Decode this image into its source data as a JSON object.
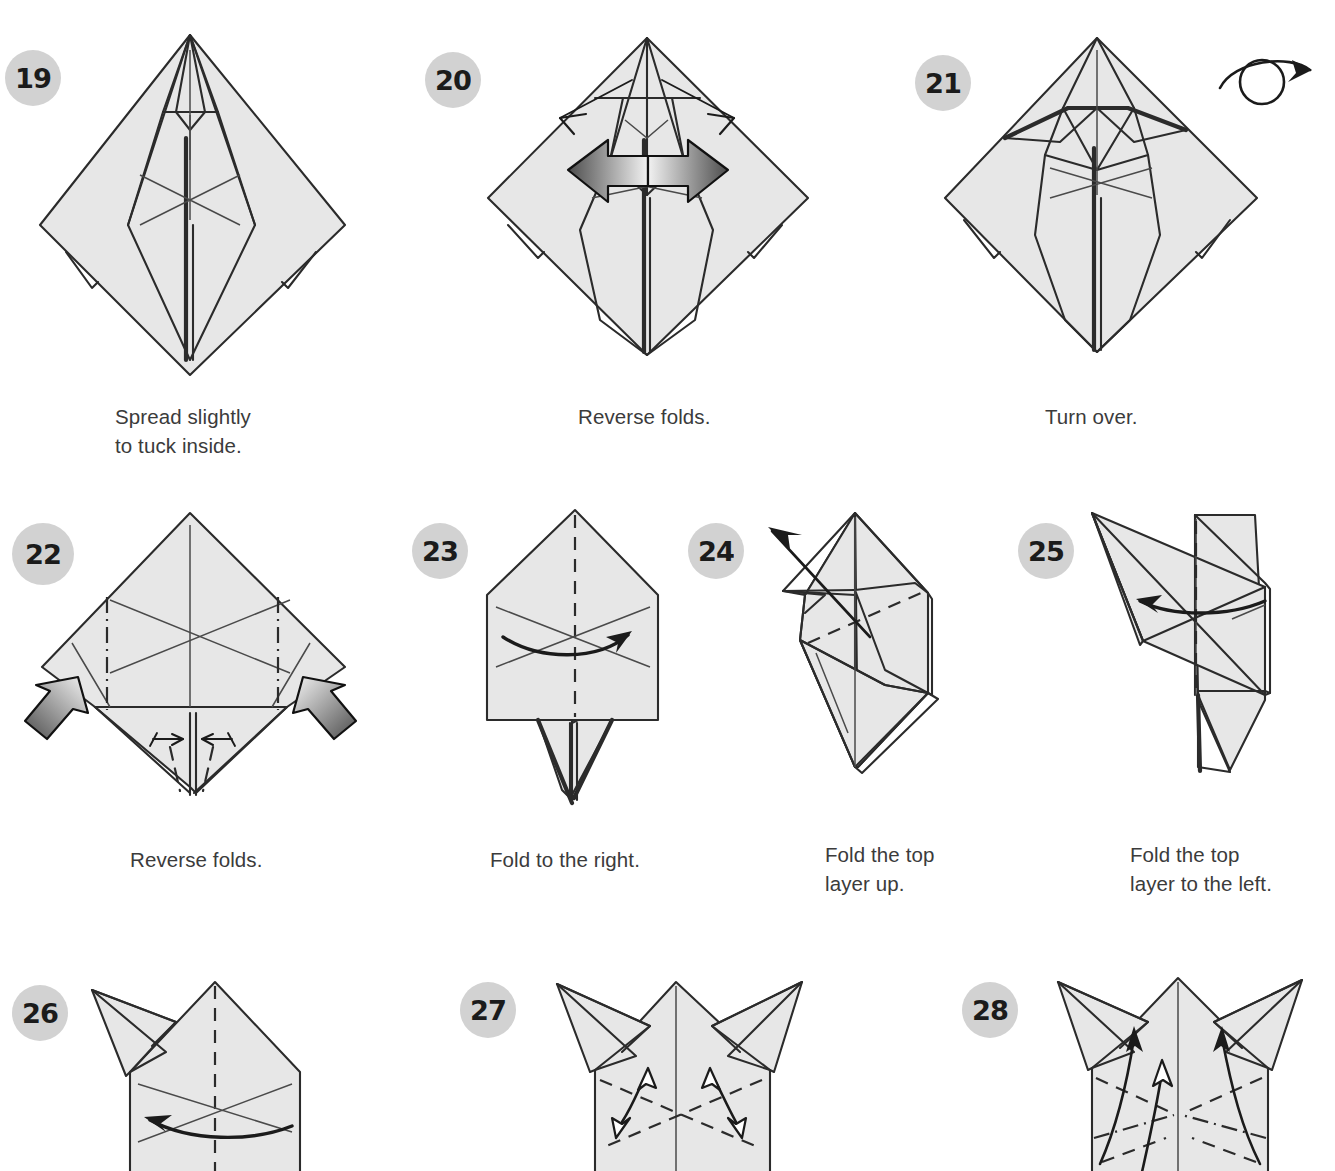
{
  "page": {
    "kind": "origami-instruction-diagram",
    "background_color": "#ffffff",
    "paper_fill_color": "#e7e7e7",
    "line_color": "#2b2b2b",
    "badge_color": "#d2d2d2",
    "badge_text_color": "#1b1b1b",
    "caption_color": "#3b3b3b",
    "columns_row1": 3,
    "columns_row2": 4,
    "columns_row3": 3
  },
  "steps": [
    {
      "number": "19",
      "caption": "Spread slightly\nto tuck inside.",
      "figure_name": "kite-shape-with-narrow-point-top",
      "markings": "dash-dot crease near top point, center creases"
    },
    {
      "number": "20",
      "caption": "Reverse folds.",
      "figure_name": "kite-shape-with-two-push-arrows",
      "markings": "two gradient push arrows inward, two thin outward arrows at top"
    },
    {
      "number": "21",
      "caption": "Turn over.",
      "figure_name": "kite-shape-with-horizontal-flaps",
      "markings": "turn-over symbol at right"
    },
    {
      "number": "22",
      "caption": "Reverse folds.",
      "figure_name": "diamond-with-flat-bottom-edges",
      "markings": "two mountain dash-dot verticals, two gradient push arrows, two small valley arrows"
    },
    {
      "number": "23",
      "caption": "Fold to the right.",
      "figure_name": "house-shape-with-tail",
      "markings": "vertical valley fold line, curved arrow pointing right"
    },
    {
      "number": "24",
      "caption": "Fold the top\nlayer up.",
      "figure_name": "side-view-folded-layers",
      "markings": "long straight arrow pointing up-left, diagonal valley fold"
    },
    {
      "number": "25",
      "caption": "Fold the top\nlayer to the left.",
      "figure_name": "side-view-with-raised-flap",
      "markings": "curved arrow pointing left, vertical valley fold"
    },
    {
      "number": "26",
      "caption": "",
      "figure_name": "house-shape-with-one-ear",
      "markings": "vertical valley fold, curved arrow pointing left"
    },
    {
      "number": "27",
      "caption": "",
      "figure_name": "house-shape-with-two-ears",
      "markings": "two diagonal valley folds, two double-headed open arrows"
    },
    {
      "number": "28",
      "caption": "",
      "figure_name": "house-shape-with-two-ears-creased",
      "markings": "dash-dot mountain folds, curved arrows pointing up"
    }
  ],
  "icons": {
    "turn_over": "turn-over-icon"
  }
}
